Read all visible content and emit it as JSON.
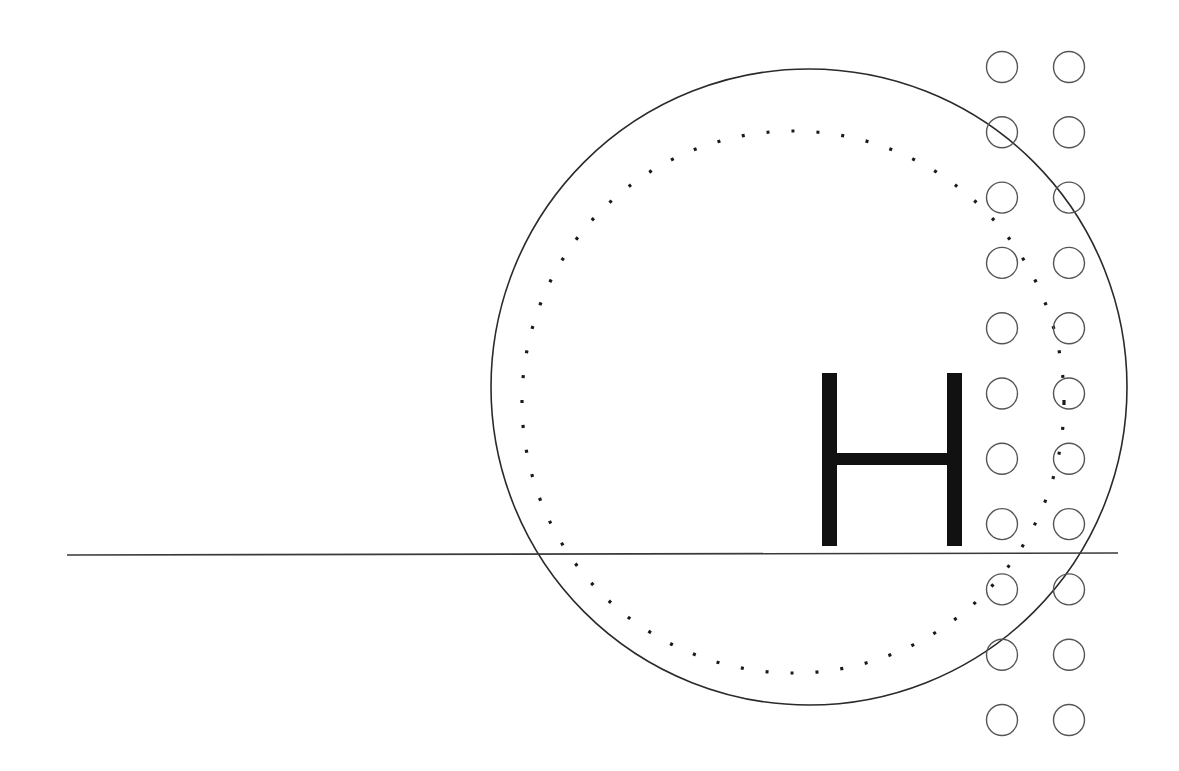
{
  "diagram": {
    "canvas": {
      "width": 1179,
      "height": 771,
      "background": "#ffffff"
    },
    "big_circle": {
      "cx": 809,
      "cy": 387,
      "r": 318,
      "stroke": "#2a2a2a",
      "stroke_width": 1.6
    },
    "dotted_circle": {
      "cx": 793,
      "cy": 402,
      "r": 271,
      "stroke": "#1a1a1a",
      "stroke_width": 3.2,
      "dash": "3 22"
    },
    "horizontal_line": {
      "x1": 67,
      "y1": 555,
      "x2": 1118,
      "y2": 553,
      "stroke": "#3a3a3a",
      "stroke_width": 1.6
    },
    "letter": {
      "text": "H",
      "color": "#111111",
      "left_bar_x": 822,
      "right_bar_x": 947,
      "bar_width": 15,
      "top_y": 373,
      "bottom_y": 546,
      "crossbar_y": 453,
      "crossbar_height": 12
    },
    "dot_grid": {
      "columns_x": [
        1002,
        1069
      ],
      "row_start_y": 67,
      "row_step": 65.3,
      "rows": 11,
      "r": 15.5,
      "stroke": "#555555",
      "stroke_width": 1.4
    }
  }
}
